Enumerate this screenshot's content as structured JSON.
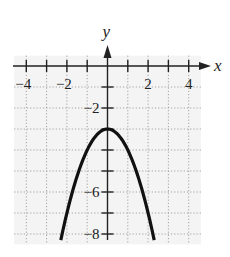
{
  "chart_data": {
    "type": "line",
    "title": "",
    "xlabel": "x",
    "ylabel": "y",
    "function": "y = -x^2 - 3",
    "series": [
      {
        "name": "parabola",
        "x": [
          -2.3,
          -2,
          -1.5,
          -1,
          -0.5,
          0,
          0.5,
          1,
          1.5,
          2,
          2.3
        ],
        "values": [
          -8.29,
          -7,
          -5.25,
          -4,
          -3.25,
          -3,
          -3.25,
          -4,
          -5.25,
          -7,
          -8.29
        ]
      }
    ],
    "vertex": [
      0,
      -3
    ],
    "xlim": [
      -4.5,
      4.5
    ],
    "ylim": [
      -8.4,
      0.4
    ],
    "x_ticks": [
      -4,
      -3,
      -2,
      -1,
      1,
      2,
      3,
      4
    ],
    "x_tick_labels": [
      {
        "value": -4,
        "text": "−4"
      },
      {
        "value": -2,
        "text": "−2"
      },
      {
        "value": 2,
        "text": "2"
      },
      {
        "value": 4,
        "text": "4"
      }
    ],
    "y_ticks": [
      -1,
      -2,
      -3,
      -4,
      -5,
      -6,
      -7,
      -8
    ],
    "y_tick_labels": [
      {
        "value": -2,
        "text": "−2"
      },
      {
        "value": -6,
        "text": "−6"
      },
      {
        "value": -8,
        "text": "−8"
      }
    ],
    "grid": true,
    "grid_style": "dotted",
    "legend": null,
    "colors": {
      "curve": "#111111",
      "axis": "#222222",
      "grid": "#9a9a9a",
      "background": "#f4f4f4"
    }
  }
}
